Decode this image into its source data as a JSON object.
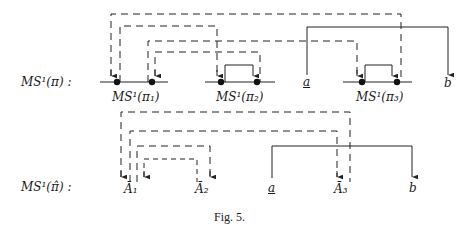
{
  "figure": {
    "caption": "Fig. 5.",
    "rows": [
      {
        "row_label": "MS¹(π) :",
        "segments": [
          {
            "label": "MS¹(π₁)"
          },
          {
            "label": "MS¹(π₂)"
          },
          {
            "label": "MS¹(π₃)"
          }
        ],
        "nodes": {
          "a": "a",
          "b": "b"
        }
      },
      {
        "row_label": "MS¹(π̂) :",
        "nodes": {
          "A1": "Ā₁",
          "A2": "Ā₂",
          "a": "a",
          "A3": "Ā₃",
          "b": "b"
        }
      }
    ],
    "colors": {
      "stroke": "#222222",
      "background": "#ffffff"
    }
  }
}
